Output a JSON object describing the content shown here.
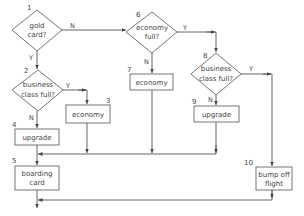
{
  "diagram": {
    "type": "flowchart",
    "nodes": [
      {
        "id": "1",
        "number": "1",
        "shape": "decision",
        "line1": "gold",
        "line2": "card?"
      },
      {
        "id": "2",
        "number": "2",
        "shape": "decision",
        "line1": "business",
        "line2": "class full?"
      },
      {
        "id": "3",
        "number": "3",
        "shape": "process",
        "line1": "economy"
      },
      {
        "id": "4",
        "number": "4",
        "shape": "process",
        "line1": "upgrade"
      },
      {
        "id": "5",
        "number": "5",
        "shape": "process",
        "line1": "boarding",
        "line2": "card"
      },
      {
        "id": "6",
        "number": "6",
        "shape": "decision",
        "line1": "economy",
        "line2": "full?"
      },
      {
        "id": "7",
        "number": "7",
        "shape": "process",
        "line1": "economy"
      },
      {
        "id": "8",
        "number": "8",
        "shape": "decision",
        "line1": "business",
        "line2": "class full?"
      },
      {
        "id": "9",
        "number": "9",
        "shape": "process",
        "line1": "upgrade"
      },
      {
        "id": "10",
        "number": "10",
        "shape": "process",
        "line1": "bump off",
        "line2": "flight"
      }
    ],
    "edges": [
      {
        "from": "1",
        "to": "6",
        "label": "N"
      },
      {
        "from": "1",
        "to": "2",
        "label": "Y"
      },
      {
        "from": "2",
        "to": "3",
        "label": "Y"
      },
      {
        "from": "2",
        "to": "4",
        "label": "N"
      },
      {
        "from": "6",
        "to": "7",
        "label": "N"
      },
      {
        "from": "6",
        "to": "8",
        "label": "Y"
      },
      {
        "from": "8",
        "to": "9",
        "label": "N"
      },
      {
        "from": "8",
        "to": "10",
        "label": "Y"
      },
      {
        "from": "4",
        "to": "5",
        "label": ""
      },
      {
        "from": "3",
        "to": "5",
        "label": ""
      },
      {
        "from": "7",
        "to": "5",
        "label": ""
      },
      {
        "from": "9",
        "to": "5",
        "label": ""
      },
      {
        "from": "5",
        "to": "end",
        "label": ""
      },
      {
        "from": "10",
        "to": "end",
        "label": ""
      }
    ],
    "edge_labels": {
      "n1_no": "N",
      "n1_yes": "Y",
      "n2_yes": "Y",
      "n2_no": "N",
      "n6_no": "N",
      "n6_yes": "Y",
      "n8_yes": "Y",
      "n8_no": "N"
    },
    "colors": {
      "stroke": "#666666",
      "text": "#444444",
      "background": "#ffffff"
    }
  }
}
